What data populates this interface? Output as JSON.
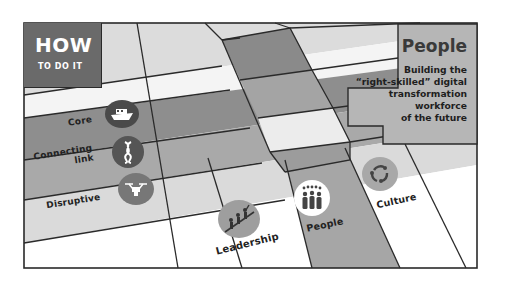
{
  "header": {
    "title": "HOW",
    "subtitle": "TO DO IT"
  },
  "focus_panel": {
    "title": "People",
    "description_lines": [
      "Building the",
      "“right-skilled” digital",
      "transformation",
      "workforce",
      "of the future"
    ]
  },
  "rows": [
    {
      "label": "Core",
      "icon": "ship-icon"
    },
    {
      "label": "Connecting link",
      "label_lines": [
        "Connecting",
        "link"
      ],
      "icon": "knot-icon"
    },
    {
      "label": "Disruptive",
      "icon": "drone-icon"
    }
  ],
  "columns": [
    {
      "label": "Leadership",
      "icon": "climbing-team-icon"
    },
    {
      "label": "People",
      "icon": "crowd-icon",
      "highlighted": true
    },
    {
      "label": "Culture",
      "icon": "cycle-arrows-icon"
    }
  ],
  "colors": {
    "frame": "#2a2a2a",
    "dark_gray": "#6a6a6a",
    "mid_gray": "#9a9a9a",
    "light_gray": "#c4c4c4",
    "pale_gray": "#e2e2e2",
    "white": "#ffffff",
    "panel_gray": "#b4b4b4"
  }
}
